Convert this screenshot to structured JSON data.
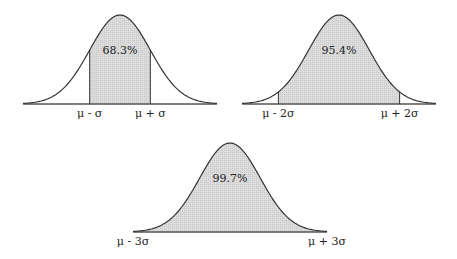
{
  "chart_data": [
    {
      "type": "area",
      "title": "",
      "distribution": "normal",
      "shaded_range_sigma": [
        -1,
        1
      ],
      "annotation": "68.3%",
      "tick_labels": [
        "μ - σ",
        "μ + σ"
      ],
      "xlim_sigma": [
        -3,
        3
      ]
    },
    {
      "type": "area",
      "title": "",
      "distribution": "normal",
      "shaded_range_sigma": [
        -2,
        2
      ],
      "annotation": "95.4%",
      "tick_labels": [
        "μ - 2σ",
        "μ + 2σ"
      ],
      "xlim_sigma": [
        -3,
        3
      ]
    },
    {
      "type": "area",
      "title": "",
      "distribution": "normal",
      "shaded_range_sigma": [
        -3,
        3
      ],
      "annotation": "99.7%",
      "tick_labels": [
        "μ - 3σ",
        "μ + 3σ"
      ],
      "xlim_sigma": [
        -3,
        3
      ]
    }
  ],
  "panels": [
    {
      "ox": 23,
      "oy": 104,
      "w": 194,
      "h": 89,
      "k": 1,
      "label": "68.3%",
      "left": "μ - σ",
      "right": "μ + σ"
    },
    {
      "ox": 242,
      "oy": 104,
      "w": 194,
      "h": 89,
      "k": 2,
      "label": "95.4%",
      "left": "μ - 2σ",
      "right": "μ + 2σ"
    },
    {
      "ox": 133,
      "oy": 232,
      "w": 194,
      "h": 89,
      "k": 3,
      "label": "99.7%",
      "left": "μ - 3σ",
      "right": "μ + 3σ"
    }
  ],
  "colors": {
    "fill": "#d9d9d9",
    "stroke": "#333333"
  }
}
